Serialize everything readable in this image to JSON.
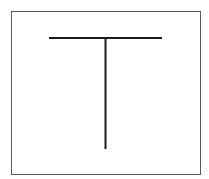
{
  "diagram": {
    "shapes": [
      {
        "name": "horizontal-bar",
        "kind": "line"
      },
      {
        "name": "vertical-stem",
        "kind": "line"
      }
    ],
    "colors": {
      "frame": "#5a5a5a",
      "stroke": "#1a1a1a",
      "background": "#ffffff"
    }
  }
}
